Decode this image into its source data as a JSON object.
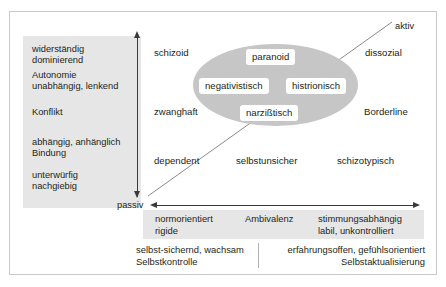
{
  "diagram": {
    "colors": {
      "panel_gray": "#e6e6e6",
      "ellipse_gray": "#c6c6c6",
      "text": "#231f20",
      "axis": "#3a3a3a",
      "frame_border": "#c9c9c9"
    }
  },
  "left_panel": {
    "blocks": [
      {
        "lines": [
          "widerständig",
          "dominierend"
        ]
      },
      {
        "lines": [
          "Autonomie",
          "unabhängig, lenkend"
        ]
      },
      {
        "lines": [
          "Konflikt"
        ]
      },
      {
        "lines": [
          "abhängig, anhänglich",
          "Bindung"
        ]
      },
      {
        "lines": [
          "unterwürfig",
          "nachgiebig"
        ]
      }
    ]
  },
  "axes": {
    "vertical": {
      "top_label": "",
      "bottom_label": "passiv"
    },
    "horizontal": {
      "left_label": "passiv",
      "right_label": ""
    },
    "diagonal": {
      "top_label": "aktiv"
    }
  },
  "ellipse": {
    "name": "cluster-ellipse",
    "chips": [
      {
        "label": "paranoid"
      },
      {
        "label": "negativistisch"
      },
      {
        "label": "histrionisch"
      },
      {
        "label": "narzißtisch"
      }
    ]
  },
  "disorders": [
    {
      "label": "schizoid"
    },
    {
      "label": "dissozial"
    },
    {
      "label": "zwanghaft"
    },
    {
      "label": "Borderline"
    },
    {
      "label": "dependent"
    },
    {
      "label": "selbstunsicher"
    },
    {
      "label": "schizotypisch"
    }
  ],
  "bottom_gray_band": {
    "cells": [
      {
        "lines": [
          "normorientiert",
          "rigide"
        ],
        "align": "left"
      },
      {
        "lines": [
          "Ambivalenz"
        ],
        "align": "center"
      },
      {
        "lines": [
          "stimmungsabhängig",
          "labil, unkontrolliert"
        ],
        "align": "left"
      }
    ]
  },
  "bottom_white_band": {
    "cells": [
      {
        "lines": [
          "selbst-sichernd, wachsam",
          "Selbstkontrolle"
        ],
        "align": "left"
      },
      {
        "lines": [
          "erfahrungsoffen, gefühlsorientiert",
          "Selbstaktualisierung"
        ],
        "align": "right"
      }
    ]
  }
}
